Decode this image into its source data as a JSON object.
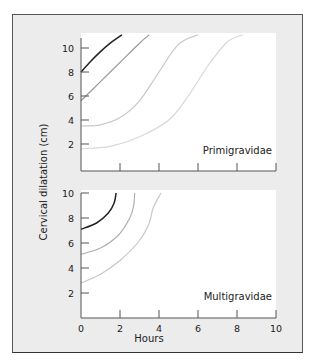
{
  "chart_data": [
    {
      "type": "line",
      "panel": "top",
      "label": "Primigravidae",
      "xlabel": "Hours",
      "ylabel": "Cervical dilatation (cm)",
      "xlim": [
        0,
        10
      ],
      "ylim": [
        0,
        11.2
      ],
      "yticks": [
        2,
        4,
        6,
        8,
        10
      ],
      "xticks": [
        0,
        2,
        4,
        6,
        8,
        10
      ],
      "grid": false,
      "series": [
        {
          "name": "start 8 cm",
          "color": "#222222",
          "points": [
            [
              0,
              8
            ],
            [
              0.5,
              8.9
            ],
            [
              1,
              9.7
            ],
            [
              1.5,
              10.4
            ],
            [
              2.1,
              11.1
            ]
          ]
        },
        {
          "name": "start 6 cm",
          "color": "#999999",
          "points": [
            [
              0,
              5.6
            ],
            [
              1,
              7.2
            ],
            [
              2,
              8.8
            ],
            [
              3,
              10.4
            ],
            [
              3.5,
              11.1
            ]
          ]
        },
        {
          "name": "start 3.5 cm",
          "color": "#c8c8c8",
          "points": [
            [
              0,
              3.5
            ],
            [
              1,
              3.6
            ],
            [
              2,
              4.2
            ],
            [
              3,
              5.6
            ],
            [
              4,
              8
            ],
            [
              5,
              10.3
            ],
            [
              6,
              11.1
            ]
          ]
        },
        {
          "name": "start 1.5 cm",
          "color": "#d8d8d8",
          "points": [
            [
              0,
              1.6
            ],
            [
              1.5,
              1.8
            ],
            [
              3,
              2.6
            ],
            [
              4.5,
              4
            ],
            [
              5.5,
              6
            ],
            [
              6.5,
              8.5
            ],
            [
              7.5,
              10.5
            ],
            [
              8.3,
              11.1
            ]
          ]
        }
      ]
    },
    {
      "type": "line",
      "panel": "bottom",
      "label": "Multigravidae",
      "xlabel": "Hours",
      "ylabel": "Cervical dilatation (cm)",
      "xlim": [
        0,
        10
      ],
      "ylim": [
        0,
        10
      ],
      "yticks": [
        2,
        4,
        6,
        8,
        10
      ],
      "xticks": [
        0,
        2,
        4,
        6,
        8,
        10
      ],
      "xticklabels": [
        "0",
        "2",
        "4",
        "6",
        "8",
        "10"
      ],
      "grid": false,
      "series": [
        {
          "name": "start 7 cm",
          "color": "#222222",
          "points": [
            [
              0,
              7.1
            ],
            [
              0.8,
              7.6
            ],
            [
              1.4,
              8.4
            ],
            [
              1.7,
              9.2
            ],
            [
              1.8,
              10
            ]
          ]
        },
        {
          "name": "start 5 cm",
          "color": "#b0b0b0",
          "points": [
            [
              0,
              5.1
            ],
            [
              1,
              5.6
            ],
            [
              1.9,
              6.6
            ],
            [
              2.5,
              8
            ],
            [
              2.7,
              9
            ],
            [
              2.75,
              10
            ]
          ]
        },
        {
          "name": "start 3 cm",
          "color": "#c8c8c8",
          "points": [
            [
              0,
              2.8
            ],
            [
              1,
              3.5
            ],
            [
              2,
              4.6
            ],
            [
              3,
              6.2
            ],
            [
              3.5,
              7.6
            ],
            [
              3.7,
              8.8
            ],
            [
              4.1,
              10
            ]
          ]
        }
      ]
    }
  ],
  "labels": {
    "ylabel": "Cervical dilatation (cm)",
    "xlabel": "Hours",
    "top_panel": "Primigravidae",
    "bottom_panel": "Multigravidae",
    "yticks": [
      "2",
      "4",
      "6",
      "8",
      "10"
    ],
    "xticks": [
      "0",
      "2",
      "4",
      "6",
      "8",
      "10"
    ]
  }
}
